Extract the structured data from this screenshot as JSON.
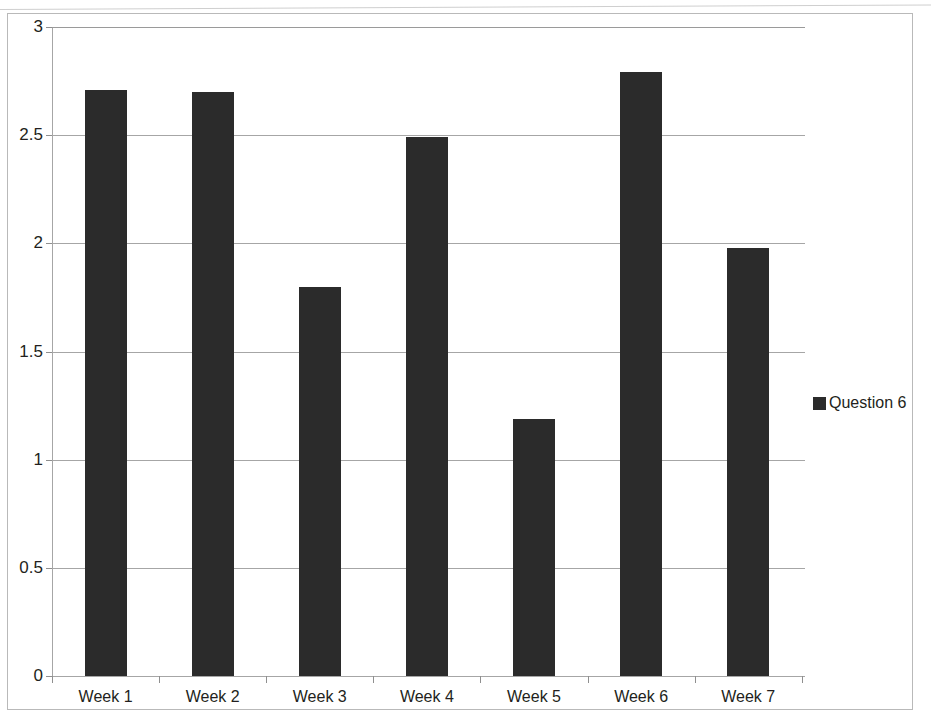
{
  "chart_data": {
    "type": "bar",
    "title": "",
    "xlabel": "",
    "ylabel": "",
    "categories": [
      "Week 1",
      "Week 2",
      "Week 3",
      "Week 4",
      "Week 5",
      "Week 6",
      "Week 7"
    ],
    "series": [
      {
        "name": "Question 6",
        "color": "#2b2b2b",
        "values": [
          2.71,
          2.7,
          1.8,
          2.49,
          1.19,
          2.79,
          1.98
        ]
      }
    ],
    "ylim": [
      0,
      3
    ],
    "ytick_labels": [
      "0",
      "0.5",
      "1",
      "1.5",
      "2",
      "2.5",
      "3"
    ],
    "ytick_values": [
      0,
      0.5,
      1,
      1.5,
      2,
      2.5,
      3
    ],
    "grid": true,
    "grid_axis": "y",
    "legend_position": "right",
    "legend_entries": [
      "Question 6"
    ]
  },
  "legend": {
    "label": "Question 6",
    "swatch_color": "#2b2b2b"
  },
  "page": {
    "clipped_title": "",
    "background_color": "#ffffff",
    "frame_color": "#b9b9b9"
  }
}
